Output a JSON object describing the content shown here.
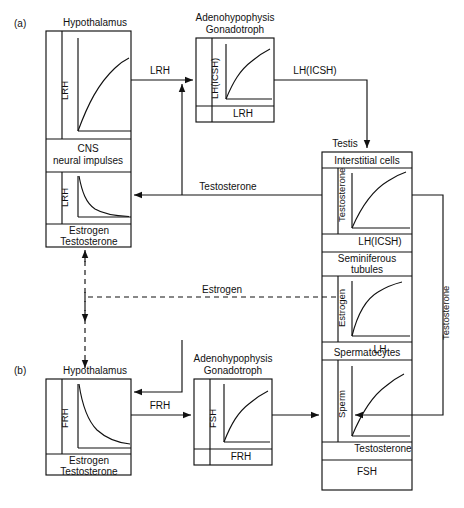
{
  "figure": {
    "type": "diagram",
    "panels": [
      {
        "id": "a",
        "label": "(a)"
      },
      {
        "id": "b",
        "label": "(b)"
      }
    ]
  },
  "panel_a": {
    "hypothalamus": {
      "title": "Hypothalamus",
      "chart_top": {
        "ylabel": "LRH",
        "xlabel": "",
        "curve": "rising-concave"
      },
      "divider_label_line1": "CNS",
      "divider_label_line2": "neural impulses",
      "chart_bottom": {
        "ylabel": "LRH",
        "curve": "falling-decay"
      },
      "xlabel_line1": "Estrogen",
      "xlabel_line2": "Testosterone"
    },
    "adenohypophysis": {
      "title_line1": "Adenohypophysis",
      "title_line2": "Gonadotroph",
      "chart": {
        "ylabel": "LH(ICSH)",
        "xlabel": "LRH",
        "curve": "rising-concave"
      }
    },
    "arrow_hypothalamus_to_pituitary": "LRH",
    "arrow_pituitary_to_testis": "LH(ICSH)"
  },
  "panel_b": {
    "hypothalamus": {
      "title": "Hypothalamus",
      "chart": {
        "ylabel": "FRH",
        "curve": "falling-decay"
      },
      "xlabel_line1": "Estrogen",
      "xlabel_line2": "Testosterone"
    },
    "adenohypophysis": {
      "title_line1": "Adenohypophysis",
      "title_line2": "Gonadotroph",
      "chart": {
        "ylabel": "FSH",
        "xlabel": "FRH",
        "curve": "rising-concave"
      }
    },
    "arrow_hypothalamus_to_pituitary": "FRH"
  },
  "testis": {
    "title": "Testis",
    "sections": [
      {
        "header": "Interstitial  cells",
        "chart": {
          "ylabel": "Testosterone",
          "xlabel": "LH(ICSH)",
          "curve": "rising-concave"
        }
      },
      {
        "header_line1": "Seminiferous",
        "header_line2": "tubules",
        "chart": {
          "ylabel": "Estrogen",
          "xlabel": "LH",
          "curve": "rising-concave"
        }
      },
      {
        "header": "Spermatocytes",
        "chart": {
          "ylabel": "Sperm",
          "xlabel": "Testosterone",
          "curve": "rising-concave"
        },
        "footer": "FSH"
      }
    ]
  },
  "feedback": {
    "testosterone_to_hypothalamus": "Testosterone",
    "estrogen_dashed": "Estrogen",
    "testosterone_right_vertical": "Testosterone"
  },
  "colors": {
    "line": "#111111",
    "background": "#ffffff",
    "text": "#111111"
  }
}
